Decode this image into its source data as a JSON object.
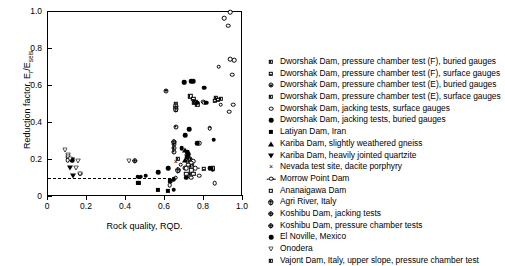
{
  "chart_data": {
    "type": "scatter",
    "title": "",
    "xlabel": "Rock quality, RQD.",
    "ylabel": "Reduction factor, E_r/E_seis",
    "ylabel_main": "Reduction factor, E",
    "ylabel_sub1": "r",
    "ylabel_mid": "/E",
    "ylabel_sub2": "seis",
    "xlim": [
      0,
      1.0
    ],
    "ylim": [
      0,
      1.0
    ],
    "xticks": [
      "0",
      "0.2",
      "0.4",
      "0.6",
      "0.8",
      "1.0"
    ],
    "xtick_values": [
      0,
      0.2,
      0.4,
      0.6,
      0.8,
      1.0
    ],
    "yticks": [
      "0",
      "0.2",
      "0.4",
      "0.6",
      "0.8",
      "1.0"
    ],
    "ytick_values": [
      0,
      0.2,
      0.4,
      0.6,
      0.8,
      1.0
    ],
    "grid": false,
    "legend_position": "right-outside",
    "annotations": [
      {
        "type": "dashed-horizontal-line",
        "y": 0.105,
        "x_start": 0.0,
        "x_end": 0.63,
        "label": ""
      }
    ],
    "series": [
      {
        "name": "Dworshak Dam, pressure chamber test (F), buried gauges",
        "marker": "half-square-vertical",
        "points": [
          [
            0.655,
            0.49
          ],
          [
            0.655,
            0.475
          ],
          [
            0.73,
            0.545
          ],
          [
            0.86,
            0.535
          ],
          [
            0.885,
            0.53
          ]
        ]
      },
      {
        "name": "Dworshak Dam, pressure chamber test (F), surface gauges",
        "marker": "half-square-horizontal",
        "points": [
          [
            0.655,
            0.505
          ],
          [
            0.745,
            0.53
          ],
          [
            0.855,
            0.52
          ],
          [
            0.87,
            0.525
          ],
          [
            0.8,
            0.152
          ]
        ]
      },
      {
        "name": "Dworshak Dam, pressure chamber test (E), buried gauges",
        "marker": "circle-dot",
        "points": [
          [
            0.605,
            0.575
          ],
          [
            0.655,
            0.38
          ],
          [
            0.645,
            0.285
          ],
          [
            0.645,
            0.265
          ],
          [
            0.645,
            0.245
          ],
          [
            0.645,
            0.3
          ],
          [
            0.715,
            0.225
          ],
          [
            0.72,
            0.215
          ],
          [
            0.73,
            0.205
          ],
          [
            0.7,
            0.155
          ],
          [
            0.715,
            0.115
          ],
          [
            0.72,
            0.19
          ]
        ]
      },
      {
        "name": "Dworshak Dam, pressure chamber test (E), surface gauges",
        "marker": "square-half-right",
        "points": [
          [
            0.735,
            0.165
          ],
          [
            0.75,
            0.51
          ],
          [
            0.755,
            0.515
          ],
          [
            0.765,
            0.5
          ],
          [
            0.665,
            0.205
          ]
        ]
      },
      {
        "name": "Dworshak Dam, jacking tests, surface gauges",
        "marker": "open-circle",
        "points": [
          [
            0.935,
            1.0
          ],
          [
            0.905,
            0.965
          ],
          [
            0.925,
            0.925
          ],
          [
            0.935,
            0.745
          ],
          [
            0.955,
            0.74
          ],
          [
            0.875,
            0.705
          ],
          [
            0.945,
            0.66
          ],
          [
            0.95,
            0.5
          ],
          [
            0.93,
            0.46
          ],
          [
            0.795,
            0.515
          ],
          [
            0.8,
            0.51
          ],
          [
            0.885,
            0.5
          ],
          [
            0.775,
            0.29
          ],
          [
            0.83,
            0.375
          ],
          [
            0.83,
            0.37
          ],
          [
            0.745,
            0.195
          ],
          [
            0.735,
            0.185
          ],
          [
            0.72,
            0.175
          ],
          [
            0.71,
            0.155
          ],
          [
            0.68,
            0.175
          ],
          [
            0.67,
            0.145
          ],
          [
            0.655,
            0.105
          ],
          [
            0.63,
            0.085
          ],
          [
            0.625,
            0.065
          ],
          [
            0.735,
            0.105
          ],
          [
            0.775,
            0.115
          ],
          [
            0.855,
            0.075
          ],
          [
            0.1,
            0.215
          ],
          [
            0.1,
            0.2
          ],
          [
            0.165,
            0.125
          ]
        ]
      },
      {
        "name": "Dworshak Dam, jacking tests, buried gauges",
        "marker": "filled-circle",
        "points": [
          [
            0.695,
            0.62
          ],
          [
            0.7,
            0.62
          ],
          [
            0.735,
            0.625
          ],
          [
            0.745,
            0.625
          ],
          [
            0.8,
            0.59
          ],
          [
            0.765,
            0.51
          ],
          [
            0.81,
            0.51
          ],
          [
            0.85,
            0.31
          ],
          [
            0.725,
            0.365
          ],
          [
            0.705,
            0.335
          ],
          [
            0.685,
            0.265
          ],
          [
            0.765,
            0.29
          ],
          [
            0.715,
            0.245
          ],
          [
            0.72,
            0.23
          ],
          [
            0.715,
            0.215
          ],
          [
            0.83,
            0.155
          ],
          [
            0.845,
            0.15
          ],
          [
            0.73,
            0.125
          ],
          [
            0.71,
            0.105
          ],
          [
            0.645,
            0.095
          ],
          [
            0.615,
            0.155
          ],
          [
            0.565,
            0.135
          ],
          [
            0.645,
            0.04
          ],
          [
            0.125,
            0.2
          ],
          [
            0.5,
            0.115
          ]
        ]
      },
      {
        "name": "Latiyan Dam, Iran",
        "marker": "filled-square",
        "points": [
          [
            0.565,
            0.04
          ],
          [
            0.615,
            0.035
          ],
          [
            0.625,
            0.085
          ],
          [
            0.465,
            0.075
          ],
          [
            0.46,
            0.075
          ]
        ]
      },
      {
        "name": "Kariba Dam, slightly weathered gneiss",
        "marker": "filled-triangle-up",
        "points": [
          [
            0.7,
            0.255
          ],
          [
            0.705,
            0.2
          ]
        ]
      },
      {
        "name": "Kariba Dam, heavily jointed quartzite",
        "marker": "filled-triangle-down",
        "points": [
          [
            0.125,
            0.2
          ],
          [
            0.13,
            0.115
          ],
          [
            0.115,
            0.155
          ]
        ]
      },
      {
        "name": "Nevada test site, dacite porphyry",
        "marker": "x-cross",
        "points": [
          [
            0.655,
            0.19
          ],
          [
            0.5,
            0.115
          ],
          [
            0.74,
            0.165
          ]
        ]
      },
      {
        "name": "Morrow Point Dam",
        "marker": "circle-whiskers",
        "points": [
          [
            0.755,
            0.155
          ]
        ]
      },
      {
        "name": "Ananaigawa Dam",
        "marker": "open-square",
        "points": [
          [
            0.735,
            0.145
          ],
          [
            0.745,
            0.125
          ],
          [
            0.71,
            0.125
          ]
        ]
      },
      {
        "name": "Agri River, Italy",
        "marker": "circle-plus",
        "points": [
          [
            0.445,
            0.195
          ],
          [
            0.665,
            0.145
          ]
        ]
      },
      {
        "name": "Koshibu Dam, jacking tests",
        "marker": "circle-plus-small",
        "points": [
          [
            0.655,
            0.49
          ],
          [
            0.655,
            0.475
          ]
        ]
      },
      {
        "name": "Koshibu Dam, pressure chamber tests",
        "marker": "circle-half",
        "points": [
          [
            0.645,
            0.3
          ]
        ]
      },
      {
        "name": "El Noville, Mexico",
        "marker": "circle-filled-small",
        "points": [
          [
            0.46,
            0.11
          ],
          [
            0.475,
            0.11
          ]
        ]
      },
      {
        "name": "Onodera",
        "marker": "open-triangle-down",
        "points": [
          [
            0.085,
            0.255
          ],
          [
            0.105,
            0.225
          ],
          [
            0.105,
            0.215
          ],
          [
            0.115,
            0.205
          ],
          [
            0.155,
            0.195
          ],
          [
            0.165,
            0.125
          ],
          [
            0.145,
            0.155
          ],
          [
            0.415,
            0.195
          ]
        ]
      },
      {
        "name": "Vajont Dam, Italy, upper slope, pressure chamber test",
        "marker": "square-half-filled",
        "points": [
          [
            0.845,
            0.155
          ]
        ]
      }
    ]
  },
  "legend": {
    "items": [
      {
        "marker": "half-square-vertical",
        "label": "Dworshak Dam, pressure chamber test (F), buried gauges"
      },
      {
        "marker": "half-square-horizontal",
        "label": "Dworshak Dam, pressure chamber test (F), surface gauges"
      },
      {
        "marker": "circle-dot",
        "label": "Dworshak Dam, pressure chamber test (E), buried gauges"
      },
      {
        "marker": "square-half-right",
        "label": "Dworshak Dam, pressure chamber test (E), surface gauges"
      },
      {
        "marker": "open-circle",
        "label": "Dworshak Dam, jacking tests, surface gauges"
      },
      {
        "marker": "filled-circle",
        "label": "Dworshak Dam, jacking tests, buried gauges"
      },
      {
        "marker": "filled-square",
        "label": "Latiyan Dam, Iran"
      },
      {
        "marker": "filled-triangle-up",
        "label": "Kariba Dam, slightly weathered gneiss"
      },
      {
        "marker": "filled-triangle-down",
        "label": "Kariba Dam, heavily jointed quartzite"
      },
      {
        "marker": "x-cross",
        "label": "Nevada test site, dacite porphyry"
      },
      {
        "marker": "circle-whiskers",
        "label": "Morrow Point Dam"
      },
      {
        "marker": "open-square",
        "label": "Ananaigawa Dam"
      },
      {
        "marker": "circle-plus",
        "label": "Agri River, Italy"
      },
      {
        "marker": "circle-plus-small",
        "label": "Koshibu Dam, jacking tests"
      },
      {
        "marker": "circle-half",
        "label": "Koshibu Dam, pressure chamber tests"
      },
      {
        "marker": "circle-filled-small",
        "label": "El Noville, Mexico"
      },
      {
        "marker": "open-triangle-down",
        "label": "Onodera"
      },
      {
        "marker": "square-half-filled",
        "label": "Vajont Dam, Italy, upper slope, pressure chamber test"
      }
    ]
  },
  "colors": {
    "ink": "#000000",
    "background": "#ffffff"
  }
}
